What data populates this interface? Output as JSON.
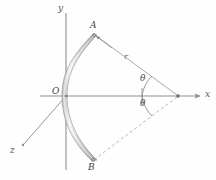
{
  "figure": {
    "background": "#fefefe",
    "stroke_color": "#8c8c8c",
    "band_fill": "#d9d9d9",
    "band_highlight": "#f2f2f2",
    "label_color": "#4a4a4a"
  },
  "axes": {
    "x": {
      "label": "x",
      "direction": "right",
      "tip": [
        203,
        96
      ],
      "origin": [
        66,
        96
      ]
    },
    "y": {
      "label": "y",
      "direction": "up",
      "tip": [
        66,
        13
      ],
      "origin": [
        66,
        96
      ]
    },
    "z": {
      "label": "z",
      "direction": "down-left",
      "tip": [
        22,
        146
      ],
      "origin": [
        66,
        96
      ]
    }
  },
  "points": {
    "origin": {
      "label": "O",
      "x": 66,
      "y": 96
    },
    "a": {
      "label": "A",
      "x": 93,
      "y": 34
    },
    "b": {
      "label": "B",
      "x": 92,
      "y": 161
    },
    "vertex": {
      "label": "",
      "x": 178,
      "y": 96
    }
  },
  "annotations": {
    "radius": {
      "label": "r",
      "x": 126,
      "y": 58
    },
    "theta_upper": {
      "label": "θ",
      "x": 143,
      "y": 79
    },
    "theta_lower": {
      "label": "θ",
      "x": 143,
      "y": 101
    }
  },
  "arc": {
    "start": [
      93,
      34
    ],
    "end": [
      92,
      161
    ],
    "bulge_x": 62,
    "thickness": 5
  }
}
